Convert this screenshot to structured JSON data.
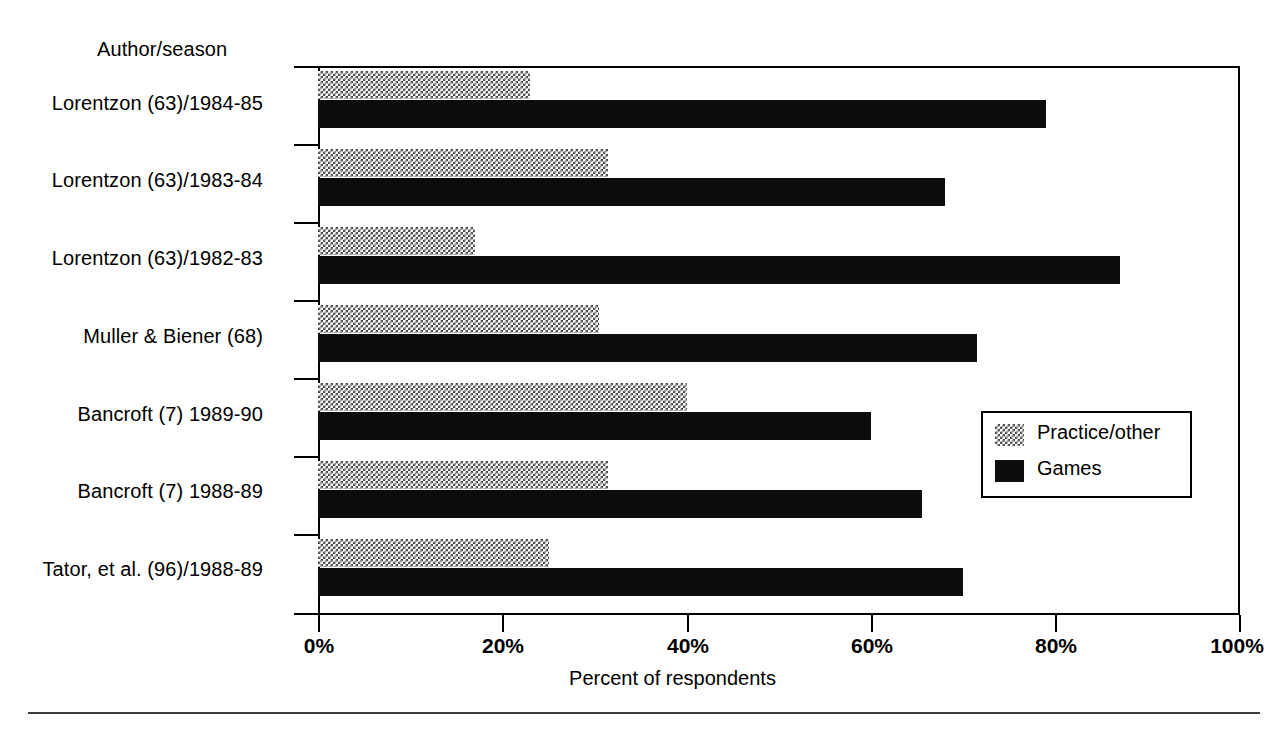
{
  "chart_data": {
    "type": "bar",
    "orientation": "horizontal",
    "stacked": false,
    "grouped": true,
    "title": "",
    "xlabel": "Percent of respondents",
    "ylabel": "Author/season",
    "xlim": [
      0,
      100
    ],
    "xticks": [
      "0%",
      "20%",
      "40%",
      "60%",
      "80%",
      "100%"
    ],
    "xtick_values": [
      0,
      20,
      40,
      60,
      80,
      100
    ],
    "grid": false,
    "legend_position": "middle-right",
    "categories": [
      "Lorentzon (63)/1984-85",
      "Lorentzon (63)/1983-84",
      "Lorentzon (63)/1982-83",
      "Muller & Biener  (68)",
      "Bancroft (7) 1989-90",
      "Bancroft (7) 1988-89",
      "Tator, et al. (96)/1988-89"
    ],
    "series": [
      {
        "name": "Practice/other",
        "color": "#bdbdbd",
        "pattern": "dotted-checker",
        "values": [
          23,
          31.5,
          17,
          30.5,
          40,
          31.5,
          25
        ]
      },
      {
        "name": "Games",
        "color": "#0d0d0d",
        "pattern": "solid",
        "values": [
          79,
          68,
          87,
          71.5,
          60,
          65.5,
          70
        ]
      }
    ]
  },
  "legend": {
    "items": [
      {
        "label": "Practice/other",
        "swatch": "dotted-checker-swatch"
      },
      {
        "label": "Games",
        "swatch": "solid-black-swatch"
      }
    ]
  }
}
